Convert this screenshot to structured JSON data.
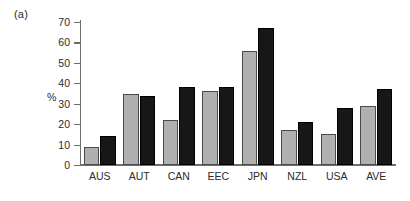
{
  "figure": {
    "panel_label": "(a)"
  },
  "chart_data": {
    "type": "bar",
    "title": "",
    "subtitle": "",
    "xlabel": "",
    "ylabel": "%",
    "ylim": [
      0,
      70
    ],
    "yticks": [
      0,
      10,
      20,
      30,
      40,
      50,
      60,
      70
    ],
    "ytick_labels": [
      "0",
      "10",
      "20",
      "30",
      "40",
      "50",
      "60",
      "70"
    ],
    "grid": false,
    "legend": false,
    "legend_position": "none",
    "categories": [
      "AUS",
      "AUT",
      "CAN",
      "EEC",
      "JPN",
      "NZL",
      "USA",
      "AVE"
    ],
    "series": [
      {
        "name": "series-1",
        "color": "#b0b0b0",
        "values": [
          9,
          35,
          22,
          36,
          56,
          17,
          15,
          29
        ]
      },
      {
        "name": "series-2",
        "color": "#171717",
        "values": [
          14,
          34,
          38,
          38,
          67,
          21,
          28,
          37
        ]
      }
    ]
  }
}
